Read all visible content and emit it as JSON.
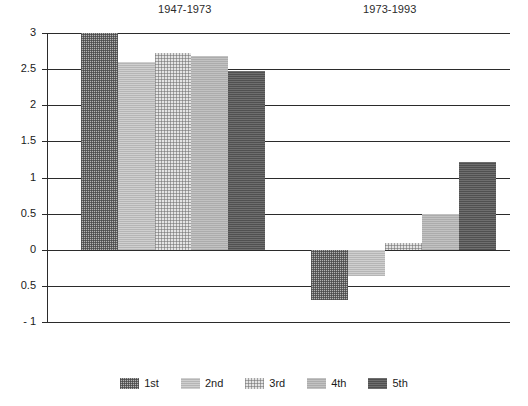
{
  "chart_data": {
    "type": "bar",
    "title": "",
    "subtitle": "",
    "xlabel": "",
    "ylabel": "",
    "ylim": [
      -1,
      3
    ],
    "grid": true,
    "grid_axis": "y",
    "legend_position": "bottom",
    "group_titles": [
      "1947-1973",
      "1973-1993"
    ],
    "categories": [
      "1947-1973",
      "1973-1993"
    ],
    "series": [
      {
        "name": "1st",
        "values": [
          3.0,
          -0.7
        ]
      },
      {
        "name": "2nd",
        "values": [
          2.6,
          -0.37
        ]
      },
      {
        "name": "3rd",
        "values": [
          2.73,
          0.1
        ]
      },
      {
        "name": "4th",
        "values": [
          2.68,
          0.5
        ]
      },
      {
        "name": "5th",
        "values": [
          2.47,
          1.21
        ]
      }
    ],
    "ytick_values": [
      3,
      2.5,
      2,
      1.5,
      1,
      0.5,
      0,
      -0.5,
      -1
    ],
    "ytick_labels": [
      "3",
      "2.5",
      "2",
      "1.5",
      "1",
      "0.5",
      "0",
      "0.5",
      "- 1"
    ],
    "note": "first bar of group 1947-1973 is clipped at the top of the axis"
  },
  "legend": {
    "items": [
      {
        "label": "1st",
        "swatch": "dither-checker-mid-gray"
      },
      {
        "label": "2nd",
        "swatch": "solid-light-gray"
      },
      {
        "label": "3rd",
        "swatch": "dotted-very-light-gray"
      },
      {
        "label": "4th",
        "swatch": "solid-mid-light-gray"
      },
      {
        "label": "5th",
        "swatch": "solid-dark-gray"
      }
    ]
  },
  "colors": {
    "axis": "#2b2b2b",
    "text": "#1a1a1a",
    "background": "#ffffff",
    "series_1st": "#b4b4b4",
    "series_2nd": "#cfcfcf",
    "series_3rd": "#e4e4e4",
    "series_4th": "#c2c2c2",
    "series_5th": "#6e6e6e"
  }
}
